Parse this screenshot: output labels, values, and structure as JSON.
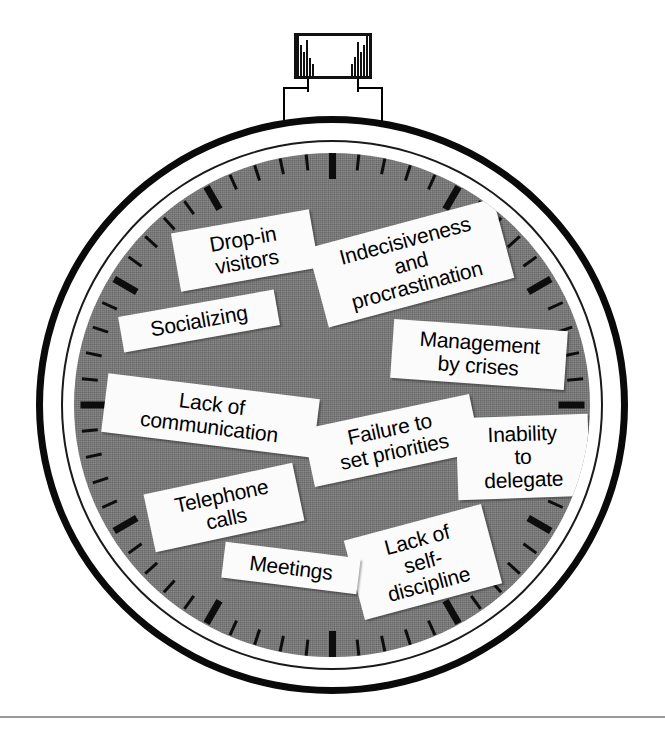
{
  "figure": {
    "dial_color": "#787878",
    "case_color": "#0a0a0a",
    "bezel_color": "#ffffff",
    "label_color": "#fbfbfb",
    "text_color": "#000000",
    "tick_color": "#0d0d0d"
  },
  "watch": {
    "crown": {
      "name": "crown-knob",
      "knurl_count_left": 6,
      "knurl_count_right": 6
    },
    "dial": {
      "major_tick_count": 12,
      "minor_ticks_between_majors": 4,
      "total_tick_count": 60
    }
  },
  "labels": [
    {
      "id": "drop-in-visitors",
      "text": "Drop-in\nvisitors",
      "x": 175,
      "y": 221,
      "rotate": -10,
      "font_size": 21,
      "width": 118
    },
    {
      "id": "indecisiveness",
      "text": "Indecisiveness\nand\nprocrastination",
      "x": 315,
      "y": 222,
      "rotate": -15,
      "font_size": 21,
      "width": 170
    },
    {
      "id": "socializing",
      "text": "Socializing",
      "x": 120,
      "y": 303,
      "rotate": -10,
      "font_size": 21,
      "width": 136
    },
    {
      "id": "management-by-crises",
      "text": "Management\nby crises",
      "x": 392,
      "y": 325,
      "rotate": 4,
      "font_size": 21,
      "width": 152
    },
    {
      "id": "lack-of-communication",
      "text": "Lack of\ncommunication",
      "x": 104,
      "y": 386,
      "rotate": 7,
      "font_size": 21,
      "width": 191
    },
    {
      "id": "failure-to-set-priorities",
      "text": "Failure to\nset priorities",
      "x": 307,
      "y": 411,
      "rotate": -12,
      "font_size": 21,
      "width": 148
    },
    {
      "id": "inability-to-delegate",
      "text": "Inability\nto\ndelegate",
      "x": 457,
      "y": 416,
      "rotate": -2,
      "font_size": 21,
      "width": 110
    },
    {
      "id": "telephone-calls",
      "text": "Telephone\ncalls",
      "x": 148,
      "y": 478,
      "rotate": -12,
      "font_size": 21,
      "width": 130
    },
    {
      "id": "lack-of-self-discipline",
      "text": "Lack of\nself-\ndiscipline",
      "x": 352,
      "y": 521,
      "rotate": -15,
      "font_size": 21,
      "width": 120
    },
    {
      "id": "meetings",
      "text": "Meetings",
      "x": 223,
      "y": 550,
      "rotate": 7,
      "font_size": 21,
      "width": 114
    }
  ]
}
